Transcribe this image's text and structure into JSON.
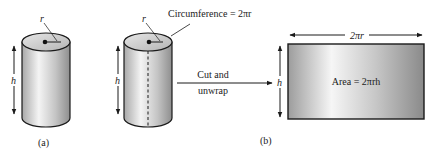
{
  "figure": {
    "panel_a": {
      "label": "(a)",
      "radius_label": "r",
      "height_label": "h"
    },
    "panel_b": {
      "label": "(b)",
      "radius_label": "r",
      "height_label": "h",
      "circumference_label": "Circumference = 2πr",
      "cut_label_line1": "Cut and",
      "cut_label_line2": "unwrap",
      "rect_width_label": "2πr",
      "rect_height_label": "h",
      "area_label": "Area = 2πrh"
    }
  },
  "colors": {
    "stroke": "#1a1a1a",
    "surface_light": "#f2f2f2",
    "surface_dark": "#9a9a9a",
    "top_face": "#c8c8c8"
  }
}
